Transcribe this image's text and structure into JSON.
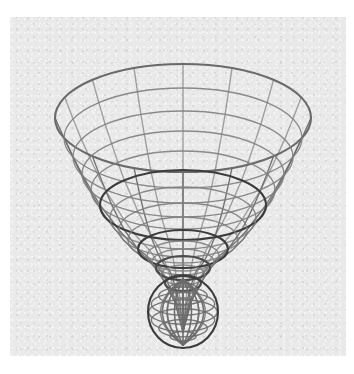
{
  "figure": {
    "title": "",
    "caption": "",
    "background_color": "#ffffff",
    "panel_color": "#e9e9e9",
    "panel": {
      "x": 10,
      "y": 17,
      "width": 336,
      "height": 339
    }
  },
  "chart_data": {
    "type": "line",
    "title": "",
    "subtitle": "",
    "xlabel": "",
    "ylabel": "",
    "grid": true,
    "legend": "none",
    "plot_kind": "3d-wireframe-surface-of-revolution",
    "projection": {
      "kind": "oblique-orthographic",
      "tilt_flatten_y": 0.42,
      "apex_screen_x": 183,
      "apex_screen_y": 318
    },
    "colors": {
      "mesh_light": "#7e7e7e",
      "mesh_mid": "#6a6a6a",
      "mesh_dark": "#3c3c3c",
      "background": "#e9e9e9"
    },
    "line_widths": {
      "normal": 1.35,
      "emphasis": 2.1
    },
    "mesh": {
      "meridian_count": 16,
      "parallel_count": 17,
      "emphasized_parallel_indices": [
        0,
        5,
        9,
        12,
        14
      ],
      "comment": "radius_units/height_units are normalized model coordinates; rings listed from widest (top rim) to narrowest (tip)."
    },
    "rings": [
      {
        "index": 0,
        "radius_units": 1.0,
        "height_units": 1.0,
        "center_y": 118,
        "radius_x": 128,
        "radius_y": 54,
        "emphasis": true,
        "color": "#6a6a6a"
      },
      {
        "index": 1,
        "radius_units": 0.93,
        "height_units": 0.865,
        "center_y": 138,
        "radius_x": 119,
        "radius_y": 50,
        "emphasis": false,
        "color": "#7e7e7e"
      },
      {
        "index": 2,
        "radius_units": 0.86,
        "height_units": 0.74,
        "center_y": 157,
        "radius_x": 110,
        "radius_y": 46,
        "emphasis": false,
        "color": "#7e7e7e"
      },
      {
        "index": 3,
        "radius_units": 0.79,
        "height_units": 0.624,
        "center_y": 174,
        "radius_x": 101,
        "radius_y": 43,
        "emphasis": false,
        "color": "#7e7e7e"
      },
      {
        "index": 4,
        "radius_units": 0.718,
        "height_units": 0.515,
        "center_y": 190,
        "radius_x": 92,
        "radius_y": 39,
        "emphasis": false,
        "color": "#7e7e7e"
      },
      {
        "index": 5,
        "radius_units": 0.645,
        "height_units": 0.416,
        "center_y": 205,
        "radius_x": 83,
        "radius_y": 35,
        "emphasis": true,
        "color": "#3c3c3c"
      },
      {
        "index": 6,
        "radius_units": 0.573,
        "height_units": 0.328,
        "center_y": 218,
        "radius_x": 73,
        "radius_y": 31,
        "emphasis": false,
        "color": "#7e7e7e"
      },
      {
        "index": 7,
        "radius_units": 0.5,
        "height_units": 0.25,
        "center_y": 230,
        "radius_x": 64,
        "radius_y": 27,
        "emphasis": false,
        "color": "#7e7e7e"
      },
      {
        "index": 8,
        "radius_units": 0.428,
        "height_units": 0.183,
        "center_y": 240,
        "radius_x": 55,
        "radius_y": 23,
        "emphasis": false,
        "color": "#7e7e7e"
      },
      {
        "index": 9,
        "radius_units": 0.355,
        "height_units": 0.126,
        "center_y": 249,
        "radius_x": 45,
        "radius_y": 19,
        "emphasis": true,
        "color": "#3c3c3c"
      },
      {
        "index": 10,
        "radius_units": 0.283,
        "height_units": 0.08,
        "center_y": 256,
        "radius_x": 36,
        "radius_y": 15,
        "emphasis": false,
        "color": "#7e7e7e"
      },
      {
        "index": 11,
        "radius_units": 0.245,
        "height_units": 0.06,
        "center_y": 262,
        "radius_x": 31,
        "radius_y": 13,
        "emphasis": false,
        "color": "#7e7e7e"
      },
      {
        "index": 12,
        "radius_units": 0.21,
        "height_units": 0.044,
        "center_y": 268,
        "radius_x": 27,
        "radius_y": 12,
        "emphasis": true,
        "color": "#4a4a4a"
      },
      {
        "index": 13,
        "radius_units": 0.175,
        "height_units": 0.031,
        "center_y": 275,
        "radius_x": 22,
        "radius_y": 10,
        "emphasis": false,
        "color": "#7e7e7e"
      },
      {
        "index": 14,
        "radius_units": 0.14,
        "height_units": 0.02,
        "center_y": 283,
        "radius_x": 18,
        "radius_y": 8,
        "emphasis": true,
        "color": "#4a4a4a"
      },
      {
        "index": 15,
        "radius_units": 0.1,
        "height_units": 0.01,
        "center_y": 292,
        "radius_x": 13,
        "radius_y": 6,
        "emphasis": false,
        "color": "#7e7e7e"
      },
      {
        "index": 16,
        "radius_units": 0.06,
        "height_units": 0.004,
        "center_y": 302,
        "radius_x": 8,
        "radius_y": 4,
        "emphasis": false,
        "color": "#7e7e7e"
      }
    ],
    "bulb": {
      "comment": "Dense rounded tip cluster at the bottom of the horn.",
      "center_x": 183,
      "center_y": 312,
      "radius_x": 35,
      "radius_y": 36,
      "outline_color": "#3c3c3c",
      "ring_count": 7,
      "meridian_count": 16
    },
    "extents_px": {
      "left": 48,
      "right": 304,
      "top": 34,
      "bottom": 348
    }
  }
}
